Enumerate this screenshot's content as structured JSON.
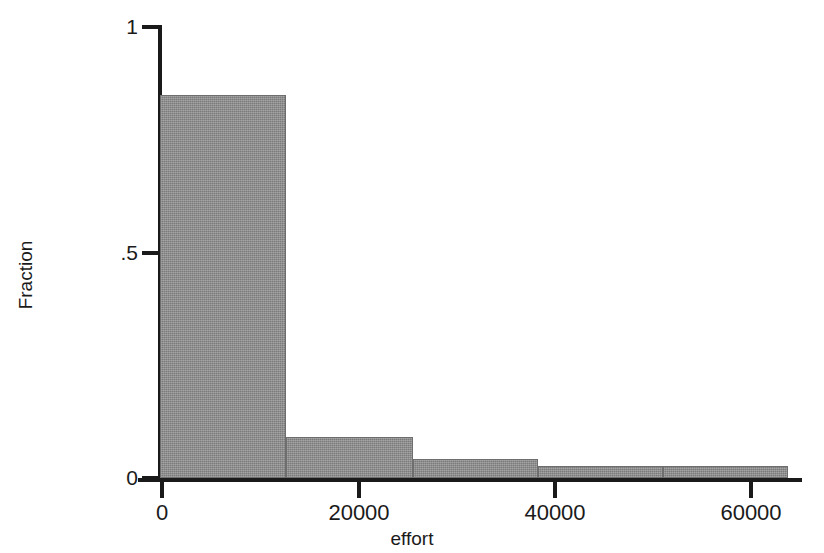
{
  "chart_data": {
    "type": "bar",
    "title": "",
    "subtitle": "",
    "xlabel": "effort",
    "ylabel": "Fraction",
    "xlim": [
      0,
      65000
    ],
    "ylim": [
      0,
      1
    ],
    "grid": false,
    "legend": null,
    "x_ticks": [
      {
        "value": 0,
        "label": "0"
      },
      {
        "value": 20000,
        "label": "20000"
      },
      {
        "value": 40000,
        "label": "40000"
      },
      {
        "value": 60000,
        "label": "60000"
      }
    ],
    "y_ticks": [
      {
        "value": 0,
        "label": "0"
      },
      {
        "value": 0.5,
        "label": ".5"
      },
      {
        "value": 1,
        "label": "1"
      }
    ],
    "bin_edges": [
      0,
      12800,
      25800,
      38500,
      51200,
      64000
    ],
    "categories": [
      "0-12800",
      "12800-25800",
      "25800-38500",
      "38500-51200",
      "51200-64000"
    ],
    "values": [
      0.85,
      0.09,
      0.042,
      0.026,
      0.026
    ],
    "bar_color": "#8a8a8a",
    "bar_edge_color": "#6e6e6e",
    "axis_color": "#1a1a1a",
    "background_color": "#ffffff"
  },
  "axes": {
    "x_title": "effort",
    "y_title": "Fraction"
  }
}
